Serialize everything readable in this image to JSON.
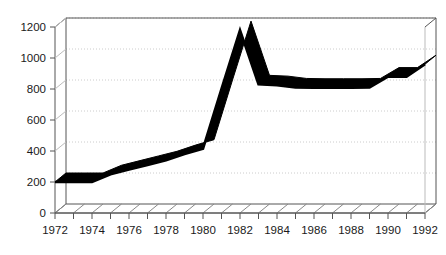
{
  "chart_data": {
    "type": "line",
    "title": "",
    "subtitle": "",
    "xlabel": "",
    "ylabel": "",
    "xlim": [
      1972,
      1992
    ],
    "ylim": [
      0,
      1200
    ],
    "grid": true,
    "legend": "none",
    "style": "3d-line-chart-with-hatched-floor",
    "x": [
      1972,
      1973,
      1974,
      1975,
      1976,
      1977,
      1978,
      1979,
      1980,
      1981,
      1982,
      1983,
      1984,
      1985,
      1986,
      1987,
      1988,
      1989,
      1990,
      1991,
      1992
    ],
    "values": [
      200,
      200,
      200,
      250,
      280,
      310,
      340,
      380,
      415,
      800,
      1180,
      830,
      825,
      810,
      808,
      808,
      808,
      810,
      880,
      880,
      960
    ],
    "series": [
      {
        "name": "series-1",
        "color": "#000000",
        "values": [
          200,
          200,
          200,
          250,
          280,
          310,
          340,
          380,
          415,
          800,
          1180,
          830,
          825,
          810,
          808,
          808,
          808,
          810,
          880,
          880,
          960
        ]
      }
    ],
    "yticks": [
      0,
      200,
      400,
      600,
      800,
      1000,
      1200
    ],
    "ytick_labels": [
      "0",
      "200",
      "400",
      "600",
      "800",
      "1000",
      "1200"
    ],
    "xticks": [
      1972,
      1973,
      1974,
      1975,
      1976,
      1977,
      1978,
      1979,
      1980,
      1981,
      1982,
      1983,
      1984,
      1985,
      1986,
      1987,
      1988,
      1989,
      1990,
      1991,
      1992
    ],
    "xtick_labels_shown": [
      "1972",
      "1974",
      "1976",
      "1978",
      "1980",
      "1982",
      "1984",
      "1986",
      "1988",
      "1990",
      "1992"
    ],
    "colors": {
      "line": "#000000",
      "axis": "#555555",
      "gridline": "#cccccc",
      "floor_hatch": "#888888",
      "background": "#ffffff",
      "text": "#1a1a1a"
    }
  }
}
